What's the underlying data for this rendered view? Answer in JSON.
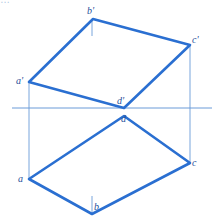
{
  "caption_fragment": "…",
  "colors": {
    "outline": "#2a6fd1",
    "construction": "#6a9bd8",
    "label": "#1f4f9a"
  },
  "labels": {
    "b_prime": "b'",
    "c_prime": "c'",
    "a_prime": "a'",
    "d_prime": "d'",
    "d": "d",
    "a": "a",
    "b": "b",
    "c": "c"
  },
  "points": {
    "b_prime": [
      93,
      19
    ],
    "c_prime": [
      190,
      45
    ],
    "a_prime": [
      29,
      82
    ],
    "d_prime": [
      124,
      108
    ],
    "d": [
      124,
      116
    ],
    "a": [
      29,
      179
    ],
    "b": [
      92,
      214
    ],
    "c": [
      190,
      163
    ]
  }
}
